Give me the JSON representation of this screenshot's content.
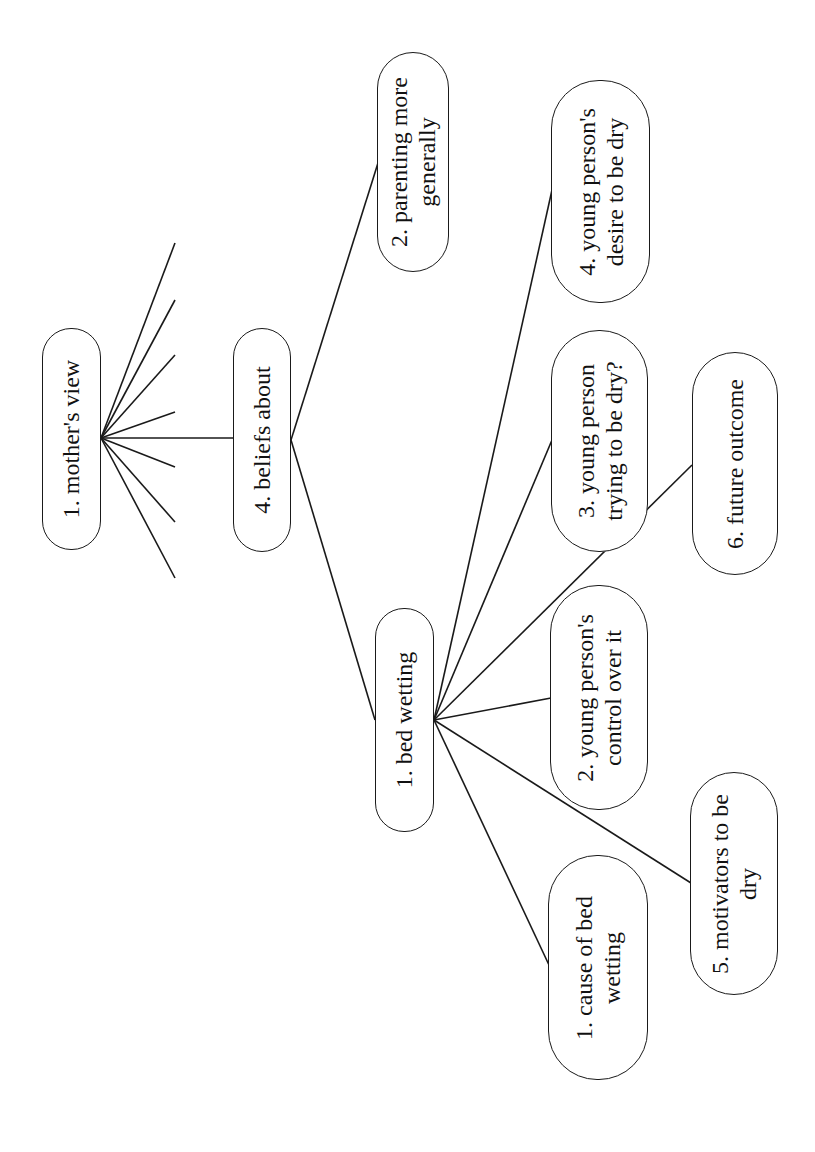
{
  "diagram": {
    "type": "tree",
    "orientation": "rotated-90-ccw",
    "colors": {
      "line": "#1a1a1a",
      "background": "#ffffff",
      "text": "#111111"
    },
    "nodes": {
      "root": {
        "lines": [
          "1. mother's view"
        ]
      },
      "beliefs": {
        "lines": [
          "4. beliefs about"
        ]
      },
      "parenting": {
        "lines": [
          "2. parenting more",
          "generally"
        ]
      },
      "bedwetting": {
        "lines": [
          "1. bed wetting"
        ]
      },
      "cause": {
        "lines": [
          "1. cause of bed",
          "wetting"
        ]
      },
      "motivators": {
        "lines": [
          "5. motivators to be",
          "dry"
        ]
      },
      "control": {
        "lines": [
          "2. young person's",
          "control over it"
        ]
      },
      "trying": {
        "lines": [
          "3. young person",
          "trying to be dry?"
        ]
      },
      "future": {
        "lines": [
          "6. future outcome"
        ]
      },
      "desire": {
        "lines": [
          "4. young person's",
          "desire to be dry"
        ]
      }
    },
    "edges": [
      [
        "root",
        "beliefs"
      ],
      [
        "beliefs",
        "parenting"
      ],
      [
        "beliefs",
        "bedwetting"
      ],
      [
        "bedwetting",
        "cause"
      ],
      [
        "bedwetting",
        "motivators"
      ],
      [
        "bedwetting",
        "control"
      ],
      [
        "bedwetting",
        "trying"
      ],
      [
        "bedwetting",
        "future"
      ],
      [
        "bedwetting",
        "desire"
      ]
    ],
    "unlabeled_root_branches": 7
  }
}
